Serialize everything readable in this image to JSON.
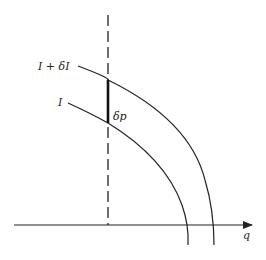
{
  "diagram": {
    "labels": {
      "outer_curve": "I + δI",
      "inner_curve": "I",
      "delta_p": "δp",
      "x_axis": "q"
    },
    "colors": {
      "line": "#222222",
      "background": "#ffffff"
    }
  }
}
